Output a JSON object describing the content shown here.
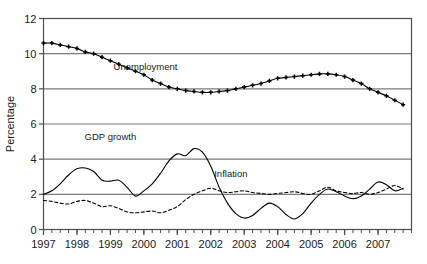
{
  "chart_data": {
    "type": "line",
    "title": "",
    "xlabel": "",
    "ylabel": "Percentage",
    "ylim": [
      0,
      12
    ],
    "xlim": [
      1997.0,
      2008.0
    ],
    "yticks": [
      "0",
      "2",
      "4",
      "6",
      "8",
      "10",
      "12"
    ],
    "ytick_values": [
      0,
      2,
      4,
      6,
      8,
      10,
      12
    ],
    "xticks": [
      "1997",
      "1998",
      "1999",
      "2000",
      "2001",
      "2002",
      "2003",
      "2004",
      "2005",
      "2006",
      "2007"
    ],
    "xtick_values": [
      1997,
      1998,
      1999,
      2000,
      2001,
      2002,
      2003,
      2004,
      2005,
      2006,
      2007
    ],
    "minor_ticks_per_year": 4,
    "grid": "horizontal",
    "legend_position": "inline-annotations",
    "x": [
      1997.0,
      1997.25,
      1997.5,
      1997.75,
      1998.0,
      1998.25,
      1998.5,
      1998.75,
      1999.0,
      1999.25,
      1999.5,
      1999.75,
      2000.0,
      2000.25,
      2000.5,
      2000.75,
      2001.0,
      2001.25,
      2001.5,
      2001.75,
      2002.0,
      2002.25,
      2002.5,
      2002.75,
      2003.0,
      2003.25,
      2003.5,
      2003.75,
      2004.0,
      2004.25,
      2004.5,
      2004.75,
      2005.0,
      2005.25,
      2005.5,
      2005.75,
      2006.0,
      2006.25,
      2006.5,
      2006.75,
      2007.0,
      2007.25,
      2007.5,
      2007.75
    ],
    "series": [
      {
        "name": "Unemployment",
        "style": "solid-with-markers",
        "marker": "plus",
        "label_x": 2000.05,
        "label_y": 9.05,
        "values": [
          10.6,
          10.6,
          10.5,
          10.4,
          10.3,
          10.1,
          10.0,
          9.8,
          9.6,
          9.4,
          9.2,
          9.0,
          8.8,
          8.5,
          8.3,
          8.1,
          8.0,
          7.9,
          7.85,
          7.8,
          7.8,
          7.85,
          7.9,
          8.0,
          8.1,
          8.2,
          8.3,
          8.45,
          8.6,
          8.65,
          8.7,
          8.75,
          8.8,
          8.85,
          8.85,
          8.8,
          8.7,
          8.5,
          8.3,
          8.0,
          7.8,
          7.6,
          7.35,
          7.1
        ]
      },
      {
        "name": "GDP growth",
        "style": "solid",
        "label_x": 1999.0,
        "label_y": 5.1,
        "values": [
          2.0,
          2.2,
          2.6,
          3.1,
          3.45,
          3.5,
          3.3,
          2.8,
          2.75,
          2.8,
          2.4,
          1.9,
          2.2,
          2.6,
          3.2,
          3.9,
          4.3,
          4.2,
          4.6,
          4.4,
          3.6,
          2.4,
          1.5,
          0.9,
          0.65,
          0.8,
          1.2,
          1.5,
          1.3,
          0.85,
          0.6,
          0.9,
          1.5,
          2.0,
          2.3,
          2.15,
          1.9,
          1.75,
          1.9,
          2.3,
          2.7,
          2.55,
          2.2,
          2.35
        ]
      },
      {
        "name": "Inflation",
        "style": "dashed",
        "label_x": 2002.6,
        "label_y": 3.0,
        "values": [
          1.65,
          1.6,
          1.5,
          1.45,
          1.6,
          1.65,
          1.5,
          1.3,
          1.35,
          1.2,
          1.0,
          0.95,
          1.0,
          1.05,
          0.95,
          1.1,
          1.3,
          1.7,
          2.0,
          2.2,
          2.35,
          2.2,
          2.1,
          2.15,
          2.2,
          2.1,
          2.05,
          2.0,
          2.05,
          2.1,
          2.15,
          2.05,
          2.0,
          2.2,
          2.4,
          2.2,
          2.1,
          2.05,
          2.1,
          2.0,
          2.1,
          2.3,
          2.5,
          2.3
        ]
      }
    ]
  },
  "axes": {
    "y_axis_title": "Percentage"
  },
  "colors": {
    "line": "#000000",
    "grid": "#7a7a7a",
    "frame": "#4d4d4d",
    "text": "#1a1a1a"
  }
}
